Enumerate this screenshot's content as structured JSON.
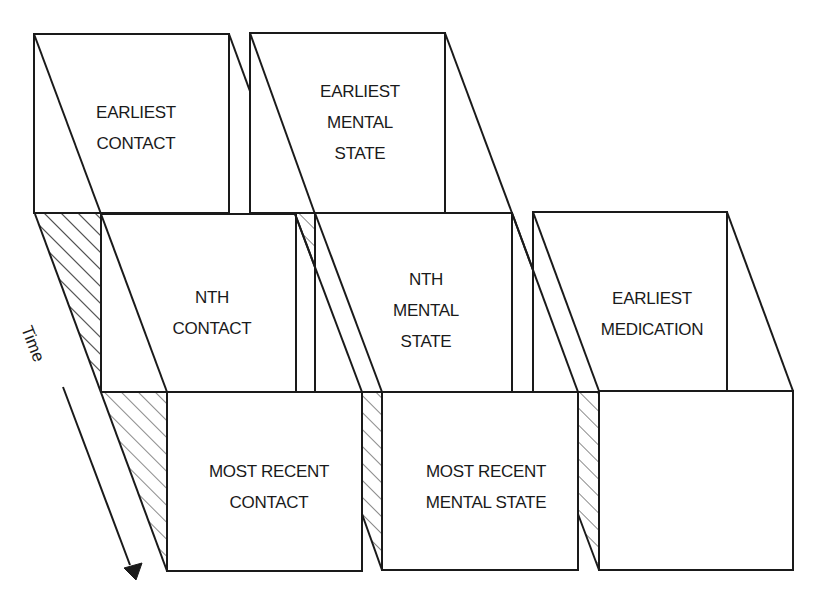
{
  "diagram": {
    "type": "layered time-series record panels",
    "axis": {
      "label": "Time",
      "direction": "toward viewer / down-right"
    },
    "columns": [
      {
        "name": "contact",
        "panels": [
          {
            "position": "back",
            "lines": [
              "EARLIEST",
              "CONTACT"
            ]
          },
          {
            "position": "middle",
            "lines": [
              "NTH",
              "CONTACT"
            ]
          },
          {
            "position": "front",
            "lines": [
              "MOST RECENT",
              "CONTACT"
            ]
          }
        ]
      },
      {
        "name": "mental-state",
        "panels": [
          {
            "position": "back",
            "lines": [
              "EARLIEST",
              "MENTAL",
              "STATE"
            ]
          },
          {
            "position": "middle",
            "lines": [
              "NTH",
              "MENTAL",
              "STATE"
            ]
          },
          {
            "position": "front",
            "lines": [
              "MOST RECENT",
              "MENTAL STATE"
            ]
          }
        ]
      },
      {
        "name": "medication",
        "panels": [
          {
            "position": "back",
            "lines": [
              "EARLIEST",
              "MEDICATION"
            ]
          },
          {
            "position": "front",
            "lines": [
              "MOST RECENT",
              "MEDICATION"
            ]
          }
        ]
      }
    ],
    "colors": {
      "stroke": "#1a1a1a",
      "background": "#ffffff",
      "hatch": "#1a1a1a"
    }
  }
}
